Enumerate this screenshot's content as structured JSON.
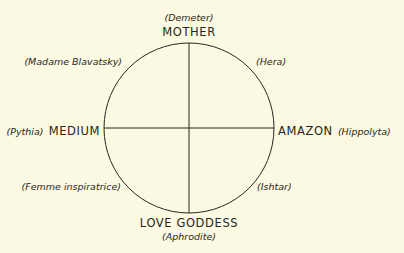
{
  "diagram": {
    "type": "circle-quadrant",
    "background": "#fbf9e2",
    "line_color": "#2a2622",
    "axes": {
      "top": {
        "label": "MOTHER",
        "example": "(Demeter)"
      },
      "bottom": {
        "label": "LOVE GODDESS",
        "example": "(Aphrodite)"
      },
      "left": {
        "label": "MEDIUM",
        "example": "(Pythia)"
      },
      "right": {
        "label": "AMAZON",
        "example": "(Hippolyta)"
      }
    },
    "diagonals": {
      "top_left": "(Madame Blavatsky)",
      "top_right": "(Hera)",
      "bottom_left": "(Femme inspiratrice)",
      "bottom_right": "(Ishtar)"
    }
  }
}
